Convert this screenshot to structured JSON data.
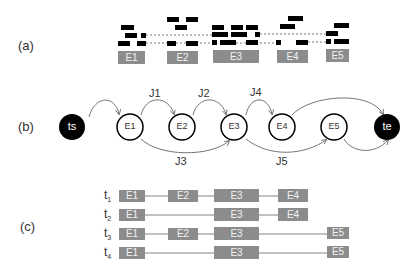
{
  "panels": {
    "a": {
      "label": "(a)",
      "events": [
        "E1",
        "E2",
        "E3",
        "E4",
        "E5"
      ]
    },
    "b": {
      "label": "(b)",
      "nodes": {
        "start": "ts",
        "end": "te",
        "events": [
          "E1",
          "E2",
          "E3",
          "E4",
          "E5"
        ]
      },
      "jumps": [
        "J1",
        "J2",
        "J3",
        "J4",
        "J5"
      ]
    },
    "c": {
      "label": "(c)",
      "traces": [
        {
          "t": "t",
          "sub": "1",
          "events": [
            "E1",
            "E2",
            "E3",
            "E4"
          ]
        },
        {
          "t": "t",
          "sub": "2",
          "events": [
            "E1",
            "E3",
            "E4"
          ]
        },
        {
          "t": "t",
          "sub": "3",
          "events": [
            "E1",
            "E2",
            "E3",
            "E5"
          ]
        },
        {
          "t": "t",
          "sub": "4",
          "events": [
            "E1",
            "E3",
            "E5"
          ]
        }
      ]
    }
  },
  "colors": {
    "box": "#8c8c8c",
    "node_fill_terminal": "#000000",
    "edge": "#555555"
  }
}
